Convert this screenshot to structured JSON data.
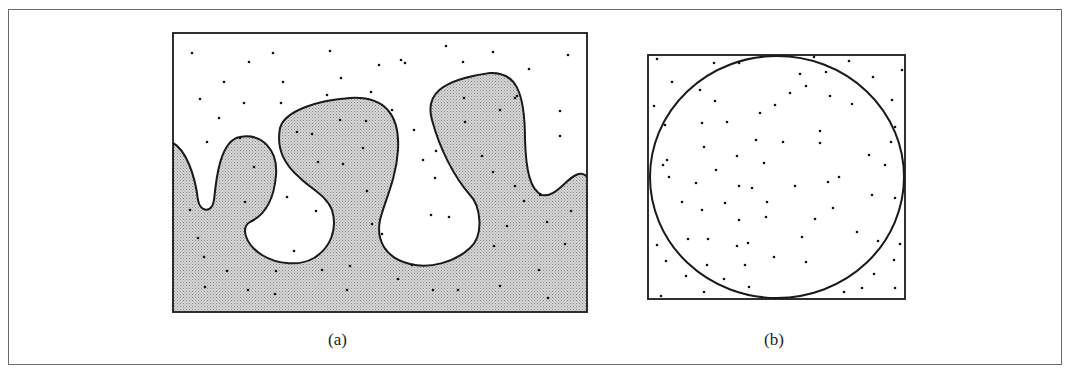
{
  "figure": {
    "panels": [
      {
        "id": "a",
        "caption": "(a)",
        "description": "Rectangle with an irregular wavy shaded region (lower part) and random points scattered both inside and outside the shaded region"
      },
      {
        "id": "b",
        "caption": "(b)",
        "description": "Square with an inscribed circle and random points scattered across the square"
      }
    ],
    "colors": {
      "frame": "#6a6a6a",
      "stroke": "#1a1a1a",
      "shade": "#c9c9c9",
      "dot": "#111111"
    }
  }
}
